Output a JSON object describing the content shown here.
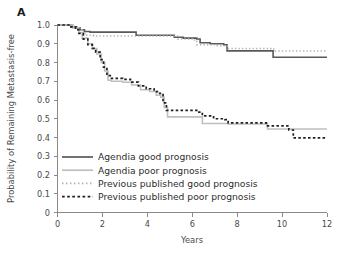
{
  "figure": {
    "panel_label": "A",
    "background_color": "#ffffff"
  },
  "chart_data": {
    "type": "line",
    "subtype": "kaplan-meier-step",
    "title": "",
    "xlabel": "Years",
    "ylabel": "Probability of Remaining Metastasis-free",
    "xlim": [
      0,
      12
    ],
    "ylim": [
      0,
      1.0
    ],
    "xticks": [
      0,
      2,
      4,
      6,
      8,
      10,
      12
    ],
    "xtick_labels": [
      "0",
      "2",
      "4",
      "6",
      "8",
      "10",
      "12"
    ],
    "yticks": [
      0,
      0.1,
      0.2,
      0.3,
      0.4,
      0.5,
      0.6,
      0.7,
      0.8,
      0.9,
      1.0
    ],
    "ytick_labels": [
      "0",
      "0.1",
      "0.2",
      "0.3",
      "0.4",
      "0.5",
      "0.6",
      "0.7",
      "0.8",
      "0.9",
      "1.0"
    ],
    "grid": false,
    "legend_position": "inside lower-left",
    "series": [
      {
        "name": "Agendia good prognosis",
        "color": "#595959",
        "style": "solid",
        "width": 1.6,
        "points": [
          [
            0.0,
            1.0
          ],
          [
            0.45,
            1.0
          ],
          [
            0.6,
            0.99
          ],
          [
            0.85,
            0.985
          ],
          [
            1.0,
            0.975
          ],
          [
            1.2,
            0.965
          ],
          [
            1.45,
            0.962
          ],
          [
            3.45,
            0.962
          ],
          [
            3.5,
            0.945
          ],
          [
            5.1,
            0.945
          ],
          [
            5.2,
            0.935
          ],
          [
            5.6,
            0.93
          ],
          [
            6.2,
            0.925
          ],
          [
            6.35,
            0.905
          ],
          [
            6.8,
            0.9
          ],
          [
            7.4,
            0.895
          ],
          [
            7.55,
            0.862
          ],
          [
            9.5,
            0.862
          ],
          [
            9.6,
            0.828
          ],
          [
            12.0,
            0.828
          ]
        ]
      },
      {
        "name": "Agendia poor prognosis",
        "color": "#bfbfbf",
        "style": "solid",
        "width": 1.6,
        "points": [
          [
            0.0,
            1.0
          ],
          [
            0.5,
            1.0
          ],
          [
            0.7,
            0.985
          ],
          [
            0.95,
            0.96
          ],
          [
            1.1,
            0.93
          ],
          [
            1.35,
            0.9
          ],
          [
            1.55,
            0.875
          ],
          [
            1.75,
            0.845
          ],
          [
            1.95,
            0.8
          ],
          [
            2.1,
            0.755
          ],
          [
            2.25,
            0.705
          ],
          [
            2.4,
            0.7
          ],
          [
            2.9,
            0.695
          ],
          [
            3.3,
            0.68
          ],
          [
            3.7,
            0.655
          ],
          [
            4.1,
            0.645
          ],
          [
            4.4,
            0.625
          ],
          [
            4.6,
            0.615
          ],
          [
            4.75,
            0.56
          ],
          [
            4.9,
            0.51
          ],
          [
            6.3,
            0.51
          ],
          [
            6.45,
            0.475
          ],
          [
            7.5,
            0.475
          ],
          [
            7.6,
            0.472
          ],
          [
            9.2,
            0.472
          ],
          [
            9.35,
            0.445
          ],
          [
            12.0,
            0.445
          ]
        ]
      },
      {
        "name": "Previous published good prognosis",
        "color": "#b0b0b0",
        "style": "dotted",
        "width": 1.5,
        "points": [
          [
            0.0,
            1.0
          ],
          [
            0.45,
            1.0
          ],
          [
            0.65,
            0.985
          ],
          [
            0.9,
            0.975
          ],
          [
            1.1,
            0.955
          ],
          [
            1.3,
            0.945
          ],
          [
            1.6,
            0.942
          ],
          [
            5.2,
            0.942
          ],
          [
            5.35,
            0.925
          ],
          [
            6.0,
            0.92
          ],
          [
            6.2,
            0.895
          ],
          [
            7.0,
            0.89
          ],
          [
            7.5,
            0.888
          ],
          [
            7.6,
            0.875
          ],
          [
            9.5,
            0.872
          ],
          [
            9.7,
            0.862
          ],
          [
            12.0,
            0.862
          ]
        ]
      },
      {
        "name": "Previous published poor prognosis",
        "color": "#1f1f1f",
        "style": "dashed",
        "width": 1.7,
        "points": [
          [
            0.0,
            1.0
          ],
          [
            0.4,
            1.0
          ],
          [
            0.55,
            0.99
          ],
          [
            0.8,
            0.975
          ],
          [
            0.95,
            0.955
          ],
          [
            1.15,
            0.925
          ],
          [
            1.35,
            0.895
          ],
          [
            1.55,
            0.875
          ],
          [
            1.7,
            0.855
          ],
          [
            1.9,
            0.815
          ],
          [
            2.05,
            0.775
          ],
          [
            2.2,
            0.73
          ],
          [
            2.35,
            0.715
          ],
          [
            2.9,
            0.71
          ],
          [
            3.25,
            0.695
          ],
          [
            3.6,
            0.675
          ],
          [
            3.95,
            0.66
          ],
          [
            4.3,
            0.645
          ],
          [
            4.55,
            0.635
          ],
          [
            4.7,
            0.585
          ],
          [
            4.85,
            0.545
          ],
          [
            6.15,
            0.545
          ],
          [
            6.3,
            0.535
          ],
          [
            6.45,
            0.515
          ],
          [
            6.95,
            0.5
          ],
          [
            7.45,
            0.495
          ],
          [
            7.6,
            0.478
          ],
          [
            9.1,
            0.478
          ],
          [
            9.3,
            0.462
          ],
          [
            10.3,
            0.44
          ],
          [
            10.5,
            0.398
          ],
          [
            12.0,
            0.398
          ]
        ]
      }
    ]
  },
  "legend": {
    "entries": [
      {
        "label": "Agendia good prognosis",
        "color": "#595959",
        "style": "solid"
      },
      {
        "label": "Agendia poor prognosis",
        "color": "#bfbfbf",
        "style": "solid"
      },
      {
        "label": "Previous published good prognosis",
        "color": "#b0b0b0",
        "style": "dotted"
      },
      {
        "label": "Previous published poor prognosis",
        "color": "#1f1f1f",
        "style": "dashed"
      }
    ]
  }
}
